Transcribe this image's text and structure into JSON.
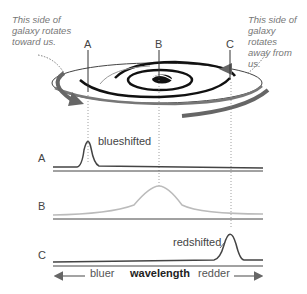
{
  "notes": {
    "left": [
      "This side of",
      "galaxy rotates",
      "toward us."
    ],
    "right": [
      "This side of",
      "galaxy rotates",
      "away from us."
    ]
  },
  "points": {
    "a": "A",
    "b": "B",
    "c": "C"
  },
  "spectra": {
    "a_label": "A",
    "b_label": "B",
    "c_label": "C",
    "a_annotation": "blueshifted",
    "c_annotation": "redshifted"
  },
  "axis": {
    "left": "bluer",
    "center": "wavelength",
    "right": "redder"
  },
  "colors": {
    "line_dark": "#555555",
    "line_light": "#bbbbbb",
    "text": "#444444",
    "arrow": "#666666"
  }
}
